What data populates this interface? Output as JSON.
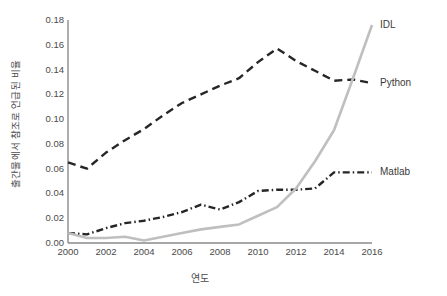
{
  "chart_data": {
    "type": "line",
    "title": "",
    "xlabel": "연도",
    "ylabel": "출간물에서 참조로 언급된 비율",
    "xlim": [
      2000,
      2016
    ],
    "ylim": [
      0.0,
      0.18
    ],
    "grid": false,
    "legend_position": "inline-right",
    "x": [
      2000,
      2001,
      2002,
      2003,
      2004,
      2005,
      2006,
      2007,
      2008,
      2009,
      2010,
      2011,
      2012,
      2013,
      2014,
      2015,
      2016
    ],
    "xtick_labels": [
      "2000",
      "2002",
      "2004",
      "2006",
      "2008",
      "2010",
      "2012",
      "2014",
      "2016"
    ],
    "xtick_values": [
      2000,
      2002,
      2004,
      2006,
      2008,
      2010,
      2012,
      2014,
      2016
    ],
    "ytick_labels": [
      "0.00",
      "0.02",
      "0.04",
      "0.06",
      "0.08",
      "0.10",
      "0.12",
      "0.14",
      "0.16",
      "0.18"
    ],
    "ytick_values": [
      0.0,
      0.02,
      0.04,
      0.06,
      0.08,
      0.1,
      0.12,
      0.14,
      0.16,
      0.18
    ],
    "series": [
      {
        "name": "Python",
        "color": "#262626",
        "style": "dashed",
        "values": [
          0.065,
          0.06,
          0.073,
          0.083,
          0.092,
          0.103,
          0.113,
          0.12,
          0.127,
          0.133,
          0.146,
          0.157,
          0.147,
          0.139,
          0.131,
          0.132,
          0.129
        ]
      },
      {
        "name": "Matlab",
        "color": "#262626",
        "style": "dash-dot",
        "values": [
          0.008,
          0.007,
          0.012,
          0.016,
          0.018,
          0.021,
          0.025,
          0.031,
          0.027,
          0.033,
          0.042,
          0.043,
          0.043,
          0.044,
          0.057,
          0.057,
          0.057
        ]
      },
      {
        "name": "IDL",
        "color": "#bfbfbf",
        "style": "solid",
        "values": [
          0.008,
          0.004,
          0.004,
          0.005,
          0.002,
          0.005,
          0.008,
          0.011,
          0.013,
          0.015,
          0.022,
          0.029,
          0.044,
          0.066,
          0.091,
          0.133,
          0.176
        ]
      }
    ],
    "annotations": [
      {
        "text": "IDL",
        "series": "IDL"
      },
      {
        "text": "Python",
        "series": "Python"
      },
      {
        "text": "Matlab",
        "series": "Matlab"
      }
    ]
  }
}
